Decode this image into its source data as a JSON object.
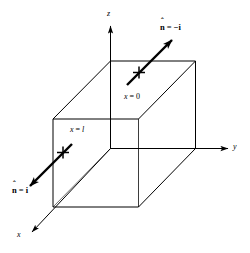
{
  "figure": {
    "type": "3d-cube-diagram",
    "background_color": "#ffffff",
    "line_color": "#000000",
    "axes": {
      "x": {
        "label": "x",
        "direction": "down-left, toward viewer"
      },
      "y": {
        "label": "y",
        "direction": "right"
      },
      "z": {
        "label": "z",
        "direction": "up"
      }
    },
    "faces": [
      {
        "id": "face-x0",
        "label_var": "x",
        "label_eq": " = ",
        "label_value": "0",
        "text": "x = 0"
      },
      {
        "id": "face-xl",
        "label_var": "x",
        "label_eq": " = ",
        "label_value": "l",
        "text": "x = l"
      }
    ],
    "normals": [
      {
        "id": "normal-minus-i",
        "symbol": "n",
        "hat": "ˆ",
        "equals": " = ",
        "value": "−i",
        "text": "n̂ = −i",
        "marker": "+",
        "direction": "up-right",
        "attached_face": "x = 0"
      },
      {
        "id": "normal-plus-i",
        "symbol": "n",
        "hat": "ˆ",
        "equals": " = ",
        "value": "i",
        "text": "n̂ = i",
        "marker": "+",
        "direction": "down-left",
        "attached_face": "x = l"
      }
    ]
  }
}
